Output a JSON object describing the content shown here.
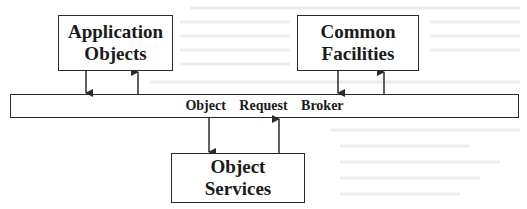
{
  "diagram": {
    "nodes": {
      "application_objects": {
        "lines": [
          "Application",
          "Objects"
        ]
      },
      "common_facilities": {
        "lines": [
          "Common",
          "Facilities"
        ]
      },
      "object_request_broker": {
        "label": "Object Request Broker"
      },
      "object_services": {
        "lines": [
          "Object",
          "Services"
        ]
      }
    },
    "edges": [
      {
        "from": "application_objects",
        "to": "object_request_broker"
      },
      {
        "from": "object_request_broker",
        "to": "application_objects"
      },
      {
        "from": "common_facilities",
        "to": "object_request_broker"
      },
      {
        "from": "object_request_broker",
        "to": "common_facilities"
      },
      {
        "from": "object_request_broker",
        "to": "object_services"
      },
      {
        "from": "object_services",
        "to": "object_request_broker"
      }
    ],
    "colors": {
      "stroke": "#2a2a2a",
      "text": "#1a1a1a",
      "background": "#ffffff"
    }
  }
}
